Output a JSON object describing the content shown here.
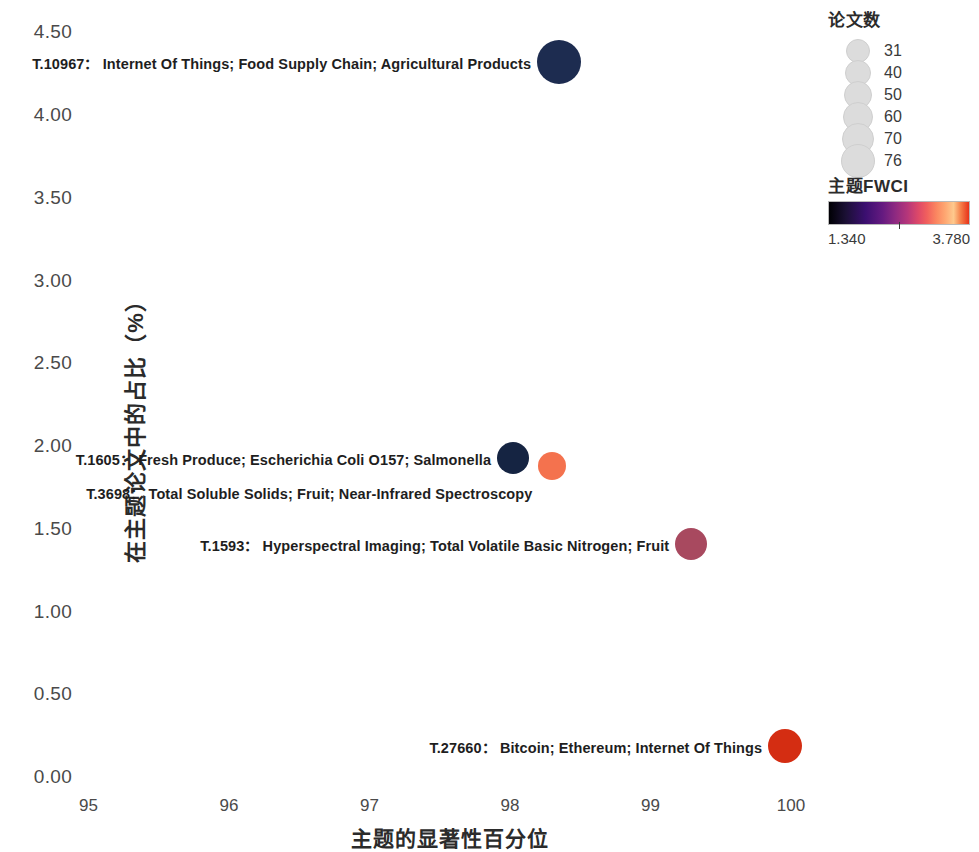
{
  "chart_data": {
    "type": "scatter",
    "title": "",
    "xlabel": "主题的显著性百分位",
    "ylabel": "在主题论文中的占比（%）",
    "xlim": [
      94.5,
      100.4
    ],
    "ylim": [
      -0.15,
      4.72
    ],
    "grid": false,
    "x_ticks": [
      95,
      96,
      97,
      98,
      99,
      100
    ],
    "x_tick_labels": [
      "95",
      "96",
      "97",
      "98",
      "99",
      "100"
    ],
    "y_ticks": [
      0.0,
      0.5,
      1.0,
      1.5,
      2.0,
      2.5,
      3.0,
      3.5,
      4.0,
      4.5
    ],
    "y_tick_labels": [
      "0.00",
      "0.50",
      "1.00",
      "1.50",
      "2.00",
      "2.50",
      "3.00",
      "3.50",
      "4.00",
      "4.50"
    ],
    "size_encoding": "论文数",
    "color_encoding": "主题FWCI",
    "points": [
      {
        "id": "T.10967",
        "keywords": "Internet Of Things; Food Supply Chain; Agricultural Products",
        "label": "T.10967：  Internet Of Things; Food Supply Chain; Agricultural Products",
        "x": 98.35,
        "y": 4.32,
        "papers": 76,
        "fwci": 1.42,
        "color": "#1d2c50",
        "radius_px": 22,
        "label_align": "right"
      },
      {
        "id": "T.1605",
        "keywords": "Fresh Produce; Escherichia Coli O157; Salmonella",
        "label": "T.1605：  Fresh Produce; Escherichia Coli O157; Salmonella",
        "x": 98.02,
        "y": 1.93,
        "papers": 50,
        "fwci": 1.36,
        "color": "#152442",
        "radius_px": 16,
        "label_align": "right"
      },
      {
        "id": "T.3698",
        "keywords": "Total Soluble Solids; Fruit; Near-Infrared Spectroscopy",
        "label": "T.3698：  Total Soluble Solids; Fruit; Near-Infrared Spectroscopy",
        "x": 98.3,
        "y": 1.88,
        "papers": 40,
        "fwci": 2.95,
        "color": "#f4724e",
        "radius_px": 14,
        "label_align": "right"
      },
      {
        "id": "T.1593",
        "keywords": "Hyperspectral Imaging; Total Volatile Basic Nitrogen; Fruit",
        "label": "T.1593：  Hyperspectral Imaging; Total Volatile Basic Nitrogen; Fruit",
        "x": 99.29,
        "y": 1.41,
        "papers": 50,
        "fwci": 2.25,
        "color": "#a8495f",
        "radius_px": 16,
        "label_align": "right"
      },
      {
        "id": "T.27660",
        "keywords": "Bitcoin; Ethereum; Internet Of Things",
        "label": "T.27660：  Bitcoin; Ethereum; Internet Of Things",
        "x": 99.96,
        "y": 0.19,
        "papers": 60,
        "fwci": 3.72,
        "color": "#d42d12",
        "radius_px": 17,
        "label_align": "right"
      }
    ],
    "size_legend": {
      "title": "论文数",
      "entries": [
        {
          "value": "31",
          "radius_px": 11
        },
        {
          "value": "40",
          "radius_px": 12
        },
        {
          "value": "50",
          "radius_px": 13
        },
        {
          "value": "60",
          "radius_px": 14
        },
        {
          "value": "70",
          "radius_px": 15
        },
        {
          "value": "76",
          "radius_px": 16
        }
      ]
    },
    "color_legend": {
      "title": "主题FWCI",
      "min": "1.340",
      "max": "3.780"
    }
  }
}
